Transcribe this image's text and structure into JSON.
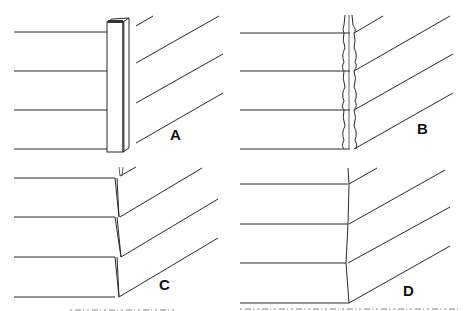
{
  "figure": {
    "panels": [
      {
        "id": "A",
        "label": "A",
        "description": "Horizontal siding butted against vertical corner boards"
      },
      {
        "id": "B",
        "label": "B",
        "description": "Siding meeting at corner with metal corner caps"
      },
      {
        "id": "C",
        "label": "C",
        "description": "Mitered siding corner with visible joint lines"
      },
      {
        "id": "D",
        "label": "D",
        "description": "Clean mitered siding corner"
      }
    ],
    "caption_note": "Caption text at bottom edge is cut off and illegible"
  },
  "colors": {
    "line": "#2a2a2a",
    "background": "#ffffff"
  }
}
